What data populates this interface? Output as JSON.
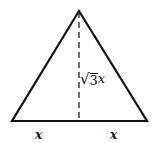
{
  "diagram": {
    "type": "isosceles-triangle-with-altitude",
    "colors": {
      "stroke": "#111111",
      "background": "#ffffff"
    },
    "vertices": {
      "apex": [
        79,
        11
      ],
      "bottom_left": [
        12,
        121
      ],
      "bottom_right": [
        147,
        121
      ]
    },
    "altitude": {
      "from": [
        79,
        11
      ],
      "to": [
        79,
        121
      ],
      "style": "dashed"
    },
    "labels": {
      "height": {
        "sqrt_symbol": "√",
        "radicand": "3",
        "variable": "x",
        "full_text": "√3x"
      },
      "left_base": "x",
      "right_base": "x"
    }
  }
}
